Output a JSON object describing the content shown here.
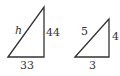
{
  "diagram": {
    "stroke_color": "#333333",
    "background": "#ffffff",
    "triangles": [
      {
        "name": "large",
        "hypotenuse_label": "h",
        "vertical_leg_label": "44",
        "horizontal_leg_label": "33"
      },
      {
        "name": "small",
        "hypotenuse_label": "5",
        "vertical_leg_label": "4",
        "horizontal_leg_label": "3"
      }
    ]
  }
}
